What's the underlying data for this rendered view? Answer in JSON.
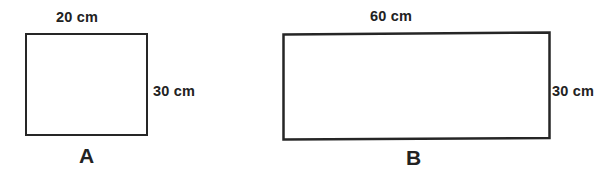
{
  "figure": {
    "background_color": "#ffffff",
    "stroke_color": "#262626",
    "text_color": "#222222",
    "width": 616,
    "height": 179,
    "shapes": [
      {
        "id": "A",
        "type": "rectangle",
        "letter": "A",
        "top_label": "20 cm",
        "side_label": "30 cm",
        "width_cm": 20,
        "height_cm": 30
      },
      {
        "id": "B",
        "type": "rectangle",
        "letter": "B",
        "top_label": "60 cm",
        "side_label": "30 cm",
        "width_cm": 60,
        "height_cm": 30
      }
    ]
  }
}
